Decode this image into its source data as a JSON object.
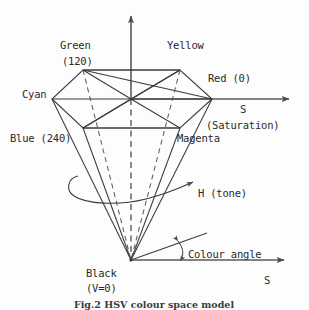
{
  "figure": {
    "title_caption": "Fig.2 HSV colour space model",
    "vertical_axis": "V",
    "axes": {
      "s_axis_top": "S",
      "s_axis_top_sub": "(Saturation)",
      "s_axis_bottom": "S"
    },
    "labels": {
      "green": "Green",
      "green_hue": "(120)",
      "yellow": "Yellow",
      "cyan": "Cyan",
      "red": "Red (0)",
      "blue": "Blue (240)",
      "magenta": "Magenta",
      "black": "Black",
      "black_value": "(V=0)",
      "hue": "H (tone)",
      "colour_angle": "Colour angle"
    },
    "colors": {
      "stroke": "#3b3b3b",
      "axis": "#555555",
      "dashed": "#6a6a6a",
      "text": "#2a2a2a",
      "background": "#fdfdfd"
    },
    "geometry": {
      "apex": [
        131,
        260
      ],
      "center_top": [
        131,
        99
      ],
      "vertices": {
        "green": [
          83,
          70
        ],
        "yellow": [
          180,
          70
        ],
        "red": [
          212,
          99
        ],
        "magenta": [
          180,
          128
        ],
        "blue": [
          83,
          128
        ],
        "cyan": [
          52,
          99
        ]
      },
      "v_axis_top": [
        131,
        12
      ],
      "s_axis_top_end": [
        295,
        99
      ],
      "s_axis_bottom_end": [
        290,
        260
      ],
      "hue_arrow_end": [
        196,
        182
      ],
      "colour_angle_ray_end": [
        207,
        233
      ]
    }
  }
}
